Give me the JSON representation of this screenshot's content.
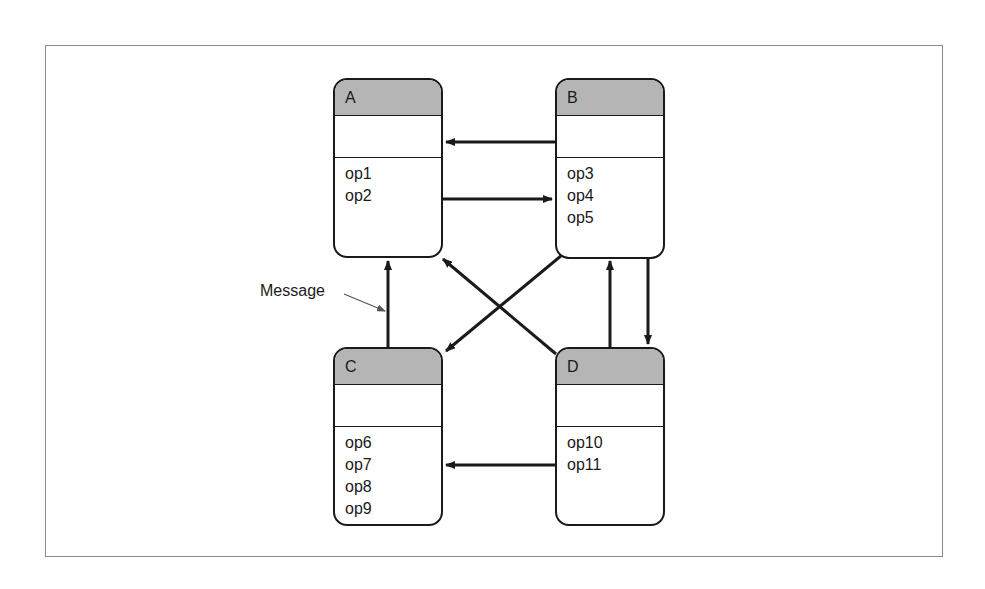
{
  "diagram": {
    "objects": [
      {
        "id": "A",
        "name": "A",
        "operations": [
          "op1",
          "op2"
        ]
      },
      {
        "id": "B",
        "name": "B",
        "operations": [
          "op3",
          "op4",
          "op5"
        ]
      },
      {
        "id": "C",
        "name": "C",
        "operations": [
          "op6",
          "op7",
          "op8",
          "op9"
        ]
      },
      {
        "id": "D",
        "name": "D",
        "operations": [
          "op10",
          "op11"
        ]
      }
    ],
    "messages": [
      {
        "from": "B",
        "to": "A"
      },
      {
        "from": "A",
        "to": "B"
      },
      {
        "from": "C",
        "to": "A"
      },
      {
        "from": "D",
        "to": "A"
      },
      {
        "from": "B",
        "to": "C"
      },
      {
        "from": "D",
        "to": "B"
      },
      {
        "from": "B",
        "to": "D"
      },
      {
        "from": "D",
        "to": "C"
      }
    ],
    "annotation": {
      "label": "Message",
      "points_to": "C-to-A message"
    },
    "colors": {
      "header_fill": "#b5b5b5",
      "stroke": "#1a1a1a",
      "frame": "#8a8a8a"
    }
  }
}
